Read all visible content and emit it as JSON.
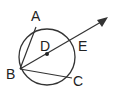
{
  "diagram": {
    "type": "geometry-circle",
    "circle": {
      "center": "D"
    },
    "points": [
      {
        "label": "A",
        "desc": "on circle"
      },
      {
        "label": "B",
        "desc": "on circle"
      },
      {
        "label": "C",
        "desc": "on circle"
      },
      {
        "label": "D",
        "desc": "center"
      },
      {
        "label": "E",
        "desc": "on circle, ray intersection"
      }
    ],
    "segments": [
      "BA",
      "BC"
    ],
    "rays": [
      "BD through E"
    ],
    "colors": {
      "stroke": "#333333",
      "text": "#222222"
    }
  }
}
